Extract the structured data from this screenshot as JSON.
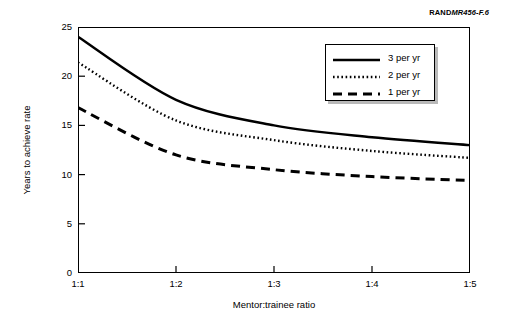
{
  "figure": {
    "source_credit": {
      "mark": "RAND",
      "id": "MR456-F.6"
    }
  },
  "chart_data": {
    "type": "line",
    "title": "",
    "xlabel": "Mentor:trainee ratio",
    "ylabel": "Years to achieve rate",
    "categories": [
      "1:1",
      "1:2",
      "1:3",
      "1:4",
      "1:5"
    ],
    "x_tick_labels": [
      "1:1",
      "1:2",
      "1:3",
      "1:4",
      "1:5"
    ],
    "y_tick_labels": [
      "0",
      "5",
      "10",
      "15",
      "20",
      "25"
    ],
    "y_ticks": [
      0,
      5,
      10,
      15,
      20,
      25
    ],
    "ylim": [
      0,
      25
    ],
    "xlim": [
      1,
      5
    ],
    "grid": false,
    "legend_position": "upper right",
    "series": [
      {
        "name": "3 per yr",
        "style": "solid",
        "color": "#000000",
        "values": [
          24.0,
          17.6,
          15.0,
          13.8,
          13.0
        ]
      },
      {
        "name": "2 per yr",
        "style": "dotted",
        "color": "#000000",
        "values": [
          21.4,
          15.5,
          13.5,
          12.4,
          11.7
        ]
      },
      {
        "name": "1 per yr",
        "style": "dashed",
        "color": "#000000",
        "values": [
          16.8,
          12.0,
          10.5,
          9.8,
          9.4
        ]
      }
    ]
  }
}
